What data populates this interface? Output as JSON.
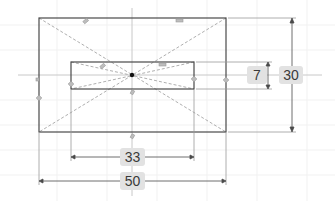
{
  "sketch": {
    "title": "Sketch",
    "colors": {
      "background": "#ffffff",
      "geometry": "#4a4a4a",
      "construction": "#9a9a9a",
      "axis": "#c8c8c8",
      "dimension_box": "#e2e2e2",
      "dimension_text": "#3a3a3a",
      "origin": "#111111"
    },
    "outer_rectangle": {
      "width": 50,
      "height": 30
    },
    "inner_rectangle": {
      "width": 33,
      "height": 7
    },
    "dimensions": [
      {
        "id": "inner-height",
        "value": "7",
        "orientation": "vertical"
      },
      {
        "id": "outer-height",
        "value": "30",
        "orientation": "vertical"
      },
      {
        "id": "inner-width",
        "value": "33",
        "orientation": "horizontal"
      },
      {
        "id": "outer-width",
        "value": "50",
        "orientation": "horizontal"
      }
    ],
    "origin_icon": "origin-point-icon",
    "constraint_icons": [
      "horizontal-constraint-icon",
      "vertical-constraint-icon",
      "coincident-constraint-icon"
    ]
  }
}
